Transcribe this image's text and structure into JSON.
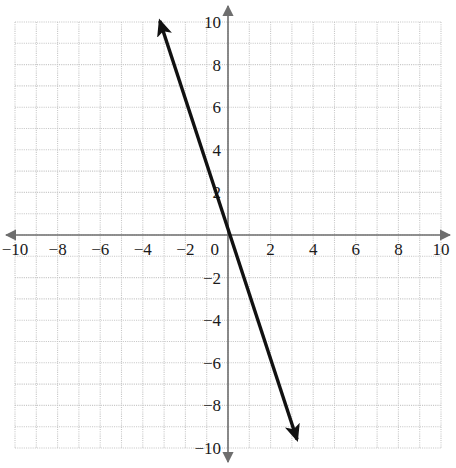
{
  "figure": {
    "title": "",
    "width": 456,
    "height": 468,
    "background_color": "#ffffff",
    "corner_mark": "21"
  },
  "axes": {
    "origin_px": {
      "x": 228,
      "y": 235
    },
    "unit_px": 21.3,
    "axis_color": "#6e6e6e",
    "axis_width": 1.6,
    "arrowheads": [
      "left",
      "right",
      "up",
      "down"
    ],
    "x_label": "",
    "y_label": "",
    "xlim": [
      -10.7,
      10.7
    ],
    "ylim": [
      -10.9,
      11.0
    ]
  },
  "grid": {
    "visible": true,
    "style": "dotted",
    "color": "#c8c8c8",
    "spacing_units": 1,
    "range": [
      -10,
      10
    ]
  },
  "labels": {
    "x_ticks": [
      "−10",
      "−8",
      "−6",
      "−4",
      "−2",
      "0",
      "2",
      "4",
      "6",
      "8",
      "10"
    ],
    "x_tick_values": [
      -10,
      -8,
      -6,
      -4,
      -2,
      0,
      2,
      4,
      6,
      8,
      10
    ],
    "y_ticks": [
      "10",
      "8",
      "6",
      "4",
      "2",
      "−2",
      "−4",
      "−6",
      "−8",
      "−10"
    ],
    "y_tick_values": [
      10,
      8,
      6,
      4,
      2,
      -2,
      -4,
      -6,
      -8,
      -10
    ],
    "origin_label": "0",
    "label_color": "#1a1a1a",
    "font_size": 17
  },
  "chart_data": {
    "type": "line",
    "title": "",
    "xlabel": "",
    "ylabel": "",
    "xlim": [
      -10.7,
      10.7
    ],
    "ylim": [
      -10.9,
      11.0
    ],
    "grid": true,
    "legend": "none",
    "series": [
      {
        "name": "line",
        "equation": "y = -3x",
        "slope": -3,
        "intercept": 0,
        "color": "#111111",
        "line_width": 3.4,
        "arrows": "both",
        "x": [
          -3.2,
          3.24
        ],
        "values": [
          10.05,
          -9.6
        ],
        "points": [
          {
            "x": -3.2,
            "y": 10.05
          },
          {
            "x": 0,
            "y": 0
          },
          {
            "x": 3.24,
            "y": -9.6
          }
        ]
      }
    ]
  }
}
